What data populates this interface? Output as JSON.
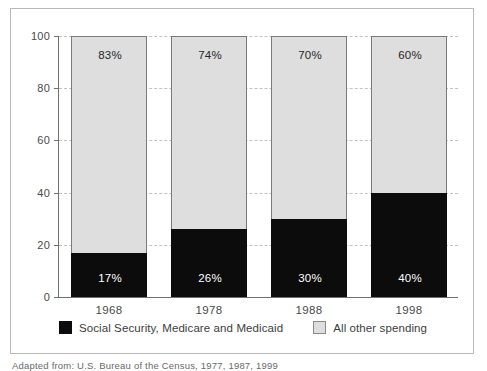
{
  "chart_data": {
    "type": "bar",
    "subtype": "stacked-100-percent",
    "title": "",
    "xlabel": "",
    "ylabel": "",
    "ylim": [
      0,
      100
    ],
    "yticks": [
      0,
      20,
      40,
      60,
      80,
      100
    ],
    "ytick_labels": [
      "0",
      "20",
      "40",
      "60",
      "80",
      "100"
    ],
    "grid": "horizontal-dashed",
    "legend_position": "bottom-center",
    "categories": [
      "1968",
      "1978",
      "1988",
      "1998"
    ],
    "series": [
      {
        "name": "Social Security, Medicare and Medicaid",
        "color": "#0c0c0c",
        "values": [
          17,
          26,
          30,
          40
        ],
        "value_labels": [
          "17%",
          "26%",
          "30%",
          "40%"
        ]
      },
      {
        "name": "All other spending",
        "color": "#dedede",
        "values": [
          83,
          74,
          70,
          60
        ],
        "value_labels": [
          "83%",
          "74%",
          "70%",
          "60%"
        ]
      }
    ]
  },
  "legend": {
    "items": [
      {
        "label": "Social Security, Medicare and Medicaid",
        "swatch": "black-square"
      },
      {
        "label": "All other spending",
        "swatch": "light-gray-square"
      }
    ]
  },
  "caption": {
    "source": "Adapted from: U.S. Bureau of the Census, 1977, 1987, 1999"
  }
}
